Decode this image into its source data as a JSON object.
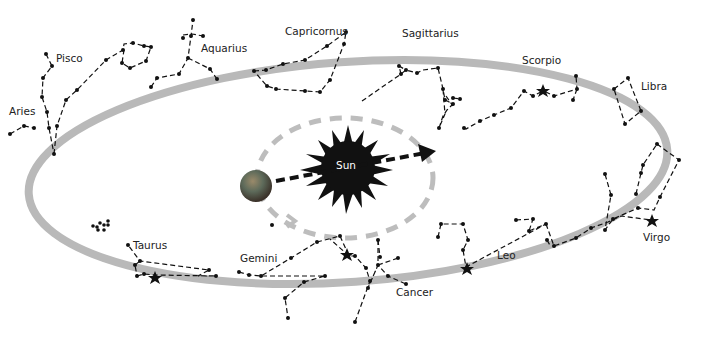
{
  "diagram": {
    "colors": {
      "ecliptic": "#b9b9b9",
      "orbit": "#bcbcbc",
      "lines": "#111111",
      "sun": "#111111",
      "earth": "#5a4a3a"
    },
    "center_label": "Sun",
    "constellations": [
      {
        "name": "Aries"
      },
      {
        "name": "Pisco"
      },
      {
        "name": "Aquarius"
      },
      {
        "name": "Capricornus"
      },
      {
        "name": "Sagittarius"
      },
      {
        "name": "Scorpio"
      },
      {
        "name": "Libra"
      },
      {
        "name": "Virgo"
      },
      {
        "name": "Leo"
      },
      {
        "name": "Cancer"
      },
      {
        "name": "Gemini"
      },
      {
        "name": "Taurus"
      }
    ]
  }
}
